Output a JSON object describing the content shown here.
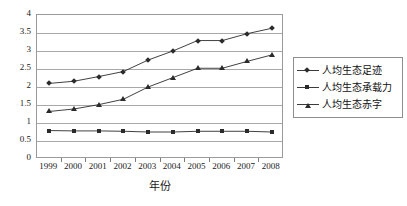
{
  "chart_data": {
    "type": "line",
    "title": "",
    "xlabel": "年份",
    "ylabel": "",
    "categories": [
      "1999",
      "2000",
      "2001",
      "2002",
      "2003",
      "2004",
      "2005",
      "2006",
      "2007",
      "2008"
    ],
    "ylim": [
      0,
      4
    ],
    "ytick_step": 0.5,
    "yticks": [
      "0",
      "0.5",
      "1",
      "1.5",
      "2",
      "2.5",
      "3",
      "3.5",
      "4"
    ],
    "grid": true,
    "legend_position": "right",
    "series": [
      {
        "name": "人均生态足迹",
        "marker": "diamond",
        "color": "#2b2b2b",
        "values": [
          2.1,
          2.16,
          2.29,
          2.43,
          2.75,
          3.0,
          3.29,
          3.29,
          3.48,
          3.63
        ]
      },
      {
        "name": "人均生态承载力",
        "marker": "square",
        "color": "#2b2b2b",
        "values": [
          0.79,
          0.78,
          0.78,
          0.77,
          0.75,
          0.75,
          0.77,
          0.77,
          0.77,
          0.75
        ]
      },
      {
        "name": "人均生态赤字",
        "marker": "triangle",
        "color": "#2b2b2b",
        "values": [
          1.32,
          1.39,
          1.51,
          1.66,
          2.0,
          2.26,
          2.52,
          2.52,
          2.71,
          2.89
        ]
      }
    ]
  },
  "legend": {
    "items": [
      {
        "label": "人均生态足迹"
      },
      {
        "label": "人均生态承载力"
      },
      {
        "label": "人均生态赤字"
      }
    ]
  },
  "axis": {
    "x_title": "年份"
  },
  "colors": {
    "background": "#ffffff",
    "gridline": "#a8a8a8",
    "frame": "#9a9a9a",
    "series": "#2b2b2b",
    "text": "#1a1a1a"
  }
}
